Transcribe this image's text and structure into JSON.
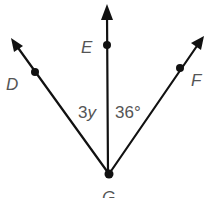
{
  "diagram": {
    "type": "angle-diagram",
    "vertex": {
      "label": "G"
    },
    "rays": [
      {
        "name": "GD",
        "point_label": "D"
      },
      {
        "name": "GE",
        "point_label": "E"
      },
      {
        "name": "GF",
        "point_label": "F"
      }
    ],
    "angles": [
      {
        "name": "DGE",
        "label": "3y"
      },
      {
        "name": "EGF",
        "label": "36°"
      }
    ]
  }
}
